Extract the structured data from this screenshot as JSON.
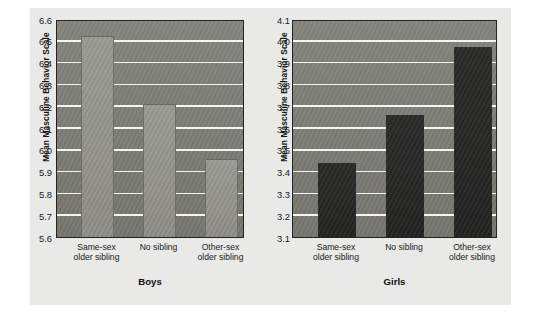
{
  "figure": {
    "background_color": "#e9e9e7",
    "page_color": "#ffffff"
  },
  "chart_data": [
    {
      "type": "bar",
      "title": "Boys",
      "xlabel": "",
      "ylabel": "Mean Masculine Behavior Scale",
      "categories": [
        "Same-sex\nolder sibling",
        "No sibling",
        "Other-sex\nolder sibling"
      ],
      "values": [
        6.52,
        6.21,
        5.96
      ],
      "ylim": [
        5.6,
        6.6
      ],
      "ytick_labels": [
        "6.6",
        "6.5",
        "6.4",
        "6.3",
        "6.2",
        "6.1",
        "6.0",
        "5.9",
        "5.8",
        "5.7",
        "5.6"
      ],
      "ytick_values": [
        6.6,
        6.5,
        6.4,
        6.3,
        6.2,
        6.1,
        6.0,
        5.9,
        5.8,
        5.7,
        5.6
      ],
      "grid": true,
      "grid_color": "#f4f4f0",
      "bar_color": "#91918a",
      "plot_background": "#7e7e78",
      "legend": null
    },
    {
      "type": "bar",
      "title": "Girls",
      "xlabel": "",
      "ylabel": "Mean Masculine Behavior Scale",
      "categories": [
        "Same-sex\nolder sibling",
        "No sibling",
        "Other-sex\nolder sibling"
      ],
      "values": [
        3.44,
        3.66,
        3.97
      ],
      "ylim": [
        3.1,
        4.1
      ],
      "ytick_labels": [
        "4.1",
        "4.0",
        "3.9",
        "3.8",
        "3.7",
        "3.6",
        "3.5",
        "3.4",
        "3.3",
        "3.2",
        "3.1"
      ],
      "ytick_values": [
        4.1,
        4.0,
        3.9,
        3.8,
        3.7,
        3.6,
        3.5,
        3.4,
        3.3,
        3.2,
        3.1
      ],
      "grid": true,
      "grid_color": "#f4f4f0",
      "bar_color": "#262624",
      "plot_background": "#7e7e78",
      "legend": null
    }
  ]
}
